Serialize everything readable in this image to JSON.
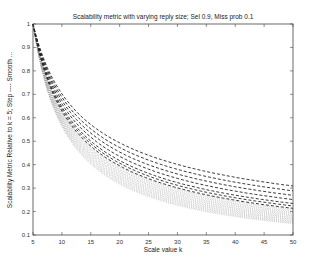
{
  "chart_data": {
    "type": "line",
    "title": "Scalability metric with varying reply size; Sel 0.9, Miss prob 0.1",
    "xlabel": "Scale value k",
    "ylabel": "Scalability Metric Relative to k = 5; Step ---- Smooth ...",
    "xlim": [
      5,
      50
    ],
    "ylim": [
      0.1,
      1.0
    ],
    "xticks": [
      5,
      10,
      15,
      20,
      25,
      30,
      35,
      40,
      45,
      50
    ],
    "yticks": [
      0.1,
      0.2,
      0.3,
      0.4,
      0.5,
      0.6,
      0.7,
      0.8,
      0.9,
      1.0
    ],
    "grid": false,
    "legend": "none",
    "x": [
      5,
      10,
      15,
      20,
      25,
      30,
      35,
      40,
      45,
      50
    ],
    "series": [
      {
        "name": "Step (dashed) upper",
        "style": "dashed",
        "values": [
          1.0,
          0.7,
          0.57,
          0.49,
          0.44,
          0.4,
          0.37,
          0.35,
          0.33,
          0.31
        ]
      },
      {
        "name": "Step (dashed) lower",
        "style": "dashed",
        "values": [
          1.0,
          0.62,
          0.47,
          0.39,
          0.34,
          0.3,
          0.27,
          0.25,
          0.23,
          0.21
        ]
      },
      {
        "name": "Smooth (dotted) upper",
        "style": "dotted",
        "values": [
          1.0,
          0.6,
          0.45,
          0.37,
          0.32,
          0.28,
          0.25,
          0.23,
          0.21,
          0.2
        ]
      },
      {
        "name": "Smooth (dotted) lower",
        "style": "dotted",
        "values": [
          1.0,
          0.57,
          0.41,
          0.32,
          0.27,
          0.23,
          0.2,
          0.18,
          0.16,
          0.15
        ]
      }
    ],
    "family": {
      "dashed_exponents": [
        0.51,
        0.54,
        0.57,
        0.6,
        0.63,
        0.65,
        0.67
      ],
      "dotted_exponents": [
        0.68,
        0.7,
        0.72,
        0.74,
        0.76,
        0.78,
        0.8,
        0.82
      ]
    }
  }
}
